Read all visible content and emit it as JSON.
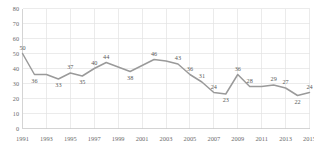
{
  "chart_data": {
    "type": "line",
    "title": "",
    "xlabel": "",
    "ylabel": "",
    "ylim": [
      0,
      80
    ],
    "ytick_step": 10,
    "yticks": [
      0,
      10,
      20,
      30,
      40,
      50,
      60,
      70,
      80
    ],
    "grid": true,
    "legend": "none",
    "line_color": "#9a9a9a",
    "grid_color": "#e2e2e2",
    "label_color": "#5a5a5a",
    "x": [
      1991,
      1992,
      1993,
      1994,
      1995,
      1996,
      1997,
      1998,
      1999,
      2000,
      2001,
      2002,
      2003,
      2004,
      2005,
      2006,
      2007,
      2008,
      2009,
      2010,
      2011,
      2012,
      2013,
      2014,
      2015
    ],
    "values": [
      50,
      36,
      36,
      33,
      37,
      35,
      40,
      44,
      41,
      38,
      42,
      46,
      45,
      43,
      36,
      31,
      24,
      23,
      36,
      28,
      28,
      29,
      27,
      22,
      24
    ],
    "point_labels": [
      {
        "x": 1991,
        "value": 50,
        "text": "50",
        "pos": "above"
      },
      {
        "x": 1992,
        "value": 36,
        "text": "36",
        "pos": "below"
      },
      {
        "x": 1994,
        "value": 33,
        "text": "33",
        "pos": "below"
      },
      {
        "x": 1995,
        "value": 37,
        "text": "37",
        "pos": "above"
      },
      {
        "x": 1996,
        "value": 35,
        "text": "35",
        "pos": "below"
      },
      {
        "x": 1997,
        "value": 40,
        "text": "40",
        "pos": "above"
      },
      {
        "x": 1998,
        "value": 44,
        "text": "44",
        "pos": "above"
      },
      {
        "x": 2000,
        "value": 38,
        "text": "38",
        "pos": "below"
      },
      {
        "x": 2002,
        "value": 46,
        "text": "46",
        "pos": "above"
      },
      {
        "x": 2004,
        "value": 43,
        "text": "43",
        "pos": "above"
      },
      {
        "x": 2005,
        "value": 36,
        "text": "36",
        "pos": "above"
      },
      {
        "x": 2006,
        "value": 31,
        "text": "31",
        "pos": "above"
      },
      {
        "x": 2007,
        "value": 24,
        "text": "24",
        "pos": "above"
      },
      {
        "x": 2008,
        "value": 23,
        "text": "23",
        "pos": "below"
      },
      {
        "x": 2009,
        "value": 36,
        "text": "36",
        "pos": "above"
      },
      {
        "x": 2010,
        "value": 28,
        "text": "28",
        "pos": "above"
      },
      {
        "x": 2012,
        "value": 29,
        "text": "29",
        "pos": "above"
      },
      {
        "x": 2013,
        "value": 27,
        "text": "27",
        "pos": "above"
      },
      {
        "x": 2014,
        "value": 22,
        "text": "22",
        "pos": "below"
      },
      {
        "x": 2015,
        "value": 24,
        "text": "24",
        "pos": "above"
      }
    ],
    "xtick_labels": [
      "1991",
      "1993",
      "1995",
      "1997",
      "1999",
      "2001",
      "2003",
      "2005",
      "2007",
      "2009",
      "2011",
      "2013",
      "2015"
    ],
    "xtick_values": [
      1991,
      1993,
      1995,
      1997,
      1999,
      2001,
      2003,
      2005,
      2007,
      2009,
      2011,
      2013,
      2015
    ],
    "ytick_labels": [
      "0",
      "10",
      "20",
      "30",
      "40",
      "50",
      "60",
      "70",
      "80"
    ]
  }
}
